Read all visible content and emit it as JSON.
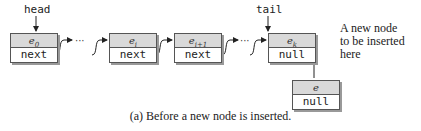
{
  "pointers": {
    "head": "head",
    "tail": "tail"
  },
  "nodes": [
    {
      "element": "e",
      "sub": "0",
      "link": "next"
    },
    {
      "element": "e",
      "sub": "i",
      "link": "next"
    },
    {
      "element": "e",
      "sub": "i+1",
      "link": "next"
    },
    {
      "element": "e",
      "sub": "k",
      "link": "null"
    }
  ],
  "new_node": {
    "element": "e",
    "sub": "",
    "link": "null"
  },
  "ellipsis": "···",
  "annotation": [
    "A new node",
    "to be inserted",
    "here"
  ],
  "caption": "(a) Before a new node is inserted."
}
